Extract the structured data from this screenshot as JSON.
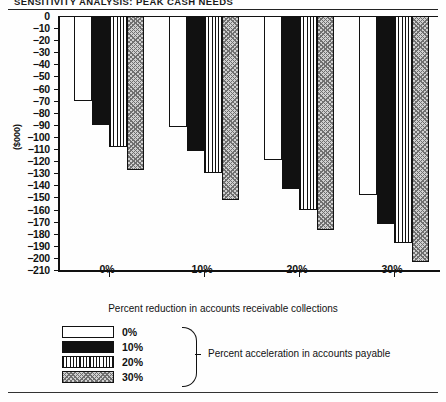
{
  "document": {
    "title": "SENSITIVITY ANALYSIS: PEAK CASH NEEDS"
  },
  "chart_data": {
    "type": "bar",
    "title": "SENSITIVITY ANALYSIS: PEAK CASH NEEDS",
    "xlabel": "Percent reduction in accounts receivable collections",
    "ylabel": "($000)",
    "categories": [
      "0%",
      "10%",
      "20%",
      "30%"
    ],
    "series": [
      {
        "name": "0%",
        "values": [
          -70,
          -92,
          -119,
          -148
        ]
      },
      {
        "name": "10%",
        "values": [
          -90,
          -112,
          -143,
          -172
        ]
      },
      {
        "name": "20%",
        "values": [
          -108,
          -130,
          -160,
          -188
        ]
      },
      {
        "name": "30%",
        "values": [
          -127,
          -152,
          -177,
          -203
        ]
      }
    ],
    "ylim": [
      -210,
      0
    ],
    "ytick_values": [
      0,
      -10,
      -20,
      -30,
      -40,
      -50,
      -60,
      -70,
      -80,
      -90,
      -100,
      -110,
      -120,
      -130,
      -140,
      -150,
      -160,
      -170,
      -180,
      -190,
      -200,
      -210
    ],
    "ytick_labels": [
      "0",
      "−10",
      "−20",
      "−30",
      "−40",
      "−50",
      "−60",
      "−70",
      "−80",
      "−90",
      "−100",
      "−110",
      "−120",
      "−130",
      "−140",
      "−150",
      "−160",
      "−170",
      "−180",
      "−190",
      "−200",
      "−210"
    ],
    "xtick_labels": [
      "0%",
      "10%",
      "20%",
      "30%"
    ],
    "grid": false,
    "legend_position": "below-plot",
    "legend_title": "Percent acceleration in accounts payable",
    "legend_entries": [
      {
        "label": "0%",
        "pattern": "white"
      },
      {
        "label": "10%",
        "pattern": "solid-black"
      },
      {
        "label": "20%",
        "pattern": "vertical-stripes"
      },
      {
        "label": "30%",
        "pattern": "stipple-dots"
      }
    ]
  }
}
